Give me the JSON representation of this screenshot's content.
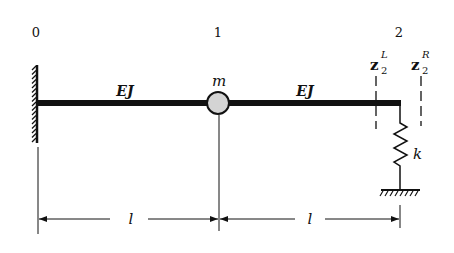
{
  "diagram": {
    "node_labels": [
      "0",
      "1",
      "2"
    ],
    "segment_labels": [
      "EJ",
      "EJ"
    ],
    "mass_label": "m",
    "spring_label": "k",
    "section_left": {
      "base": "z",
      "sub": "2",
      "sup": "L"
    },
    "section_right": {
      "base": "z",
      "sub": "2",
      "sup": "R"
    },
    "dimension_labels": [
      "l",
      "l"
    ],
    "colors": {
      "ink": "#111111",
      "mass_fill": "#d4d4d4",
      "background": "#ffffff"
    }
  }
}
